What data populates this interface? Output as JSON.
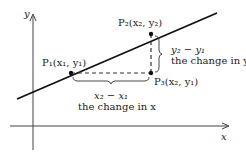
{
  "diagram": {
    "axes": {
      "x_label": "x",
      "y_label": "y"
    },
    "points": [
      {
        "name": "P1",
        "label": "P₁(x₁, y₁)"
      },
      {
        "name": "P2",
        "label": "P₂(x₂, y₂)"
      },
      {
        "name": "P3",
        "label": "P₃(x₂, y₁)"
      }
    ],
    "rise": {
      "expr": "y₂ − y₁",
      "desc": "the change in y"
    },
    "run": {
      "expr": "x₂ − x₁",
      "desc": "the change in x"
    },
    "colors": {
      "line": "#111111",
      "dashed": "#333333",
      "axes": "#444444"
    }
  }
}
